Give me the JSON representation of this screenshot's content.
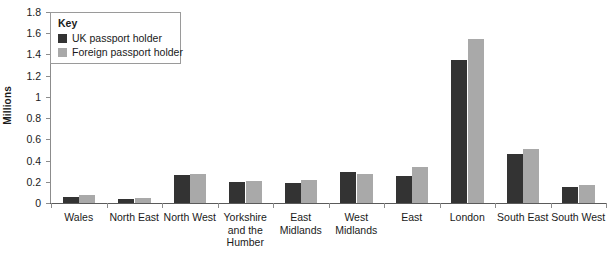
{
  "chart_data": {
    "type": "bar",
    "title": "",
    "xlabel": "",
    "ylabel": "Millions",
    "ylim": [
      0,
      1.8
    ],
    "ytick_step": 0.2,
    "yticks": [
      "0",
      "0.2",
      "0.4",
      "0.6",
      "0.8",
      "1",
      "1.2",
      "1.4",
      "1.6",
      "1.8"
    ],
    "grid": false,
    "legend_position": "top-left",
    "legend_title": "Key",
    "categories": [
      "Wales",
      "North East",
      "North West",
      "Yorkshire and the Humber",
      "East Midlands",
      "West Midlands",
      "East",
      "London",
      "South East",
      "South West"
    ],
    "series": [
      {
        "name": "UK passport holder",
        "color": "#333333",
        "values": [
          0.06,
          0.04,
          0.26,
          0.2,
          0.19,
          0.29,
          0.25,
          1.35,
          0.46,
          0.15
        ]
      },
      {
        "name": "Foreign passport holder",
        "color": "#a9a9a9",
        "values": [
          0.08,
          0.05,
          0.27,
          0.21,
          0.22,
          0.27,
          0.34,
          1.55,
          0.51,
          0.17
        ]
      }
    ]
  },
  "axis": {
    "baseline_color": "#5a5a5a",
    "tick_color": "#8c8c8c"
  }
}
